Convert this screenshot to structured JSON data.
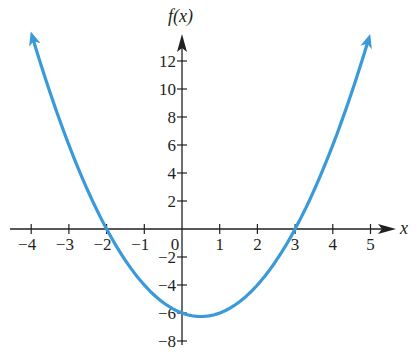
{
  "chart_data": {
    "type": "line",
    "title": "",
    "function": "f(x) = x^2 - x - 6",
    "xlabel": "x",
    "ylabel": "f(x)",
    "xlim": [
      -4.5,
      5.6
    ],
    "ylim": [
      -8.8,
      14
    ],
    "x_ticks": [
      -4,
      -3,
      -2,
      -1,
      0,
      1,
      2,
      3,
      4,
      5
    ],
    "x_tick_labels": [
      "−4",
      "−3",
      "−2",
      "−1",
      "0",
      "1",
      "2",
      "3",
      "4",
      "5"
    ],
    "y_ticks": [
      12,
      10,
      8,
      6,
      4,
      2,
      -2,
      -4,
      -6,
      -8
    ],
    "y_tick_labels": [
      "12",
      "10",
      "8",
      "6",
      "4",
      "2",
      "−2",
      "−4",
      "−6",
      "−8"
    ],
    "grid": false,
    "legend": null,
    "series": [
      {
        "name": "f(x)",
        "color": "#3a9ad9",
        "x": [
          -3.95,
          -3.5,
          -3,
          -2.5,
          -2,
          -1.5,
          -1,
          -0.5,
          0,
          0.5,
          1,
          1.5,
          2,
          2.5,
          3,
          3.5,
          4,
          4.5,
          4.93
        ],
        "y": [
          13.55,
          9.75,
          6,
          2.75,
          0,
          -2.25,
          -4,
          -5.25,
          -6,
          -6.25,
          -6,
          -5.25,
          -4,
          -2.25,
          0,
          2.75,
          6,
          9.75,
          13.37
        ]
      }
    ],
    "key_points": {
      "x_intercepts": [
        -2,
        3
      ],
      "y_intercept": -6,
      "vertex": [
        0.5,
        -6.25
      ]
    },
    "end_arrows": "both ends of curve have arrowheads pointing upward"
  },
  "colors": {
    "curve": "#3a9ad9",
    "axes": "#231f20",
    "background": "#ffffff"
  }
}
